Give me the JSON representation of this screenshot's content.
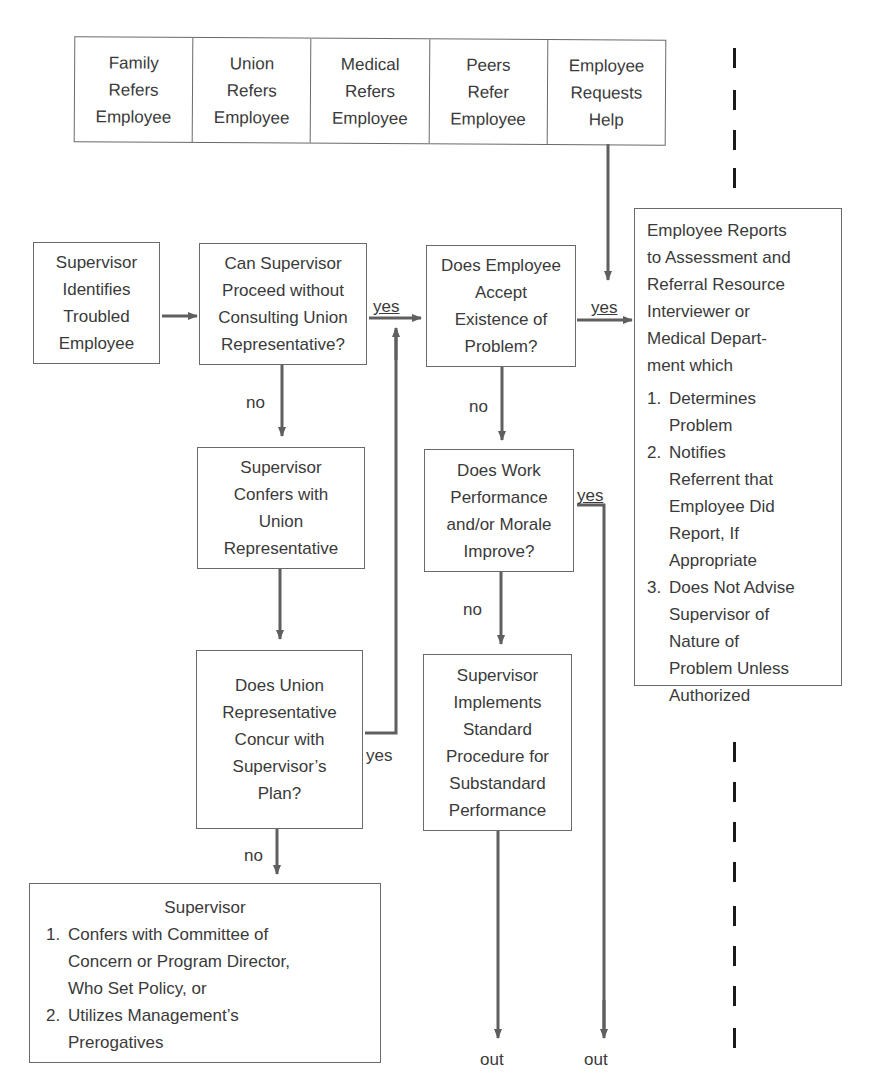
{
  "header": {
    "title": "PHASE I"
  },
  "referral_sources": [
    {
      "lines": [
        "Family",
        "Refers",
        "Employee"
      ]
    },
    {
      "lines": [
        "Union",
        "Refers",
        "Employee"
      ]
    },
    {
      "lines": [
        "Medical",
        "Refers",
        "Employee"
      ]
    },
    {
      "lines": [
        "Peers",
        "Refer",
        "Employee"
      ]
    },
    {
      "lines": [
        "Employee",
        "Requests",
        "Help"
      ]
    }
  ],
  "nodes": {
    "identify": {
      "lines": [
        "Supervisor",
        "Identifies",
        "Troubled",
        "Employee"
      ]
    },
    "proceed_without_union": {
      "lines": [
        "Can Supervisor",
        "Proceed without",
        "Consulting Union",
        "Representative?"
      ]
    },
    "accept_problem": {
      "lines": [
        "Does Employee",
        "Accept",
        "Existence of",
        "Problem?"
      ]
    },
    "confer_union": {
      "lines": [
        "Supervisor",
        "Confers with",
        "Union",
        "Representative"
      ]
    },
    "union_concur": {
      "lines": [
        "Does Union",
        "Representative",
        "Concur with",
        "Supervisor’s",
        "Plan?"
      ]
    },
    "performance_improve": {
      "lines": [
        "Does Work",
        "Performance",
        "and/or Morale",
        "Improve?"
      ]
    },
    "standard_procedure": {
      "lines": [
        "Supervisor",
        "Implements",
        "Standard",
        "Procedure for",
        "Substandard",
        "Performance"
      ]
    },
    "assessment": {
      "intro_lines": [
        "Employee Reports",
        "to Assessment and",
        "Referral Resource",
        "Interviewer or",
        "Medical Depart-",
        "ment which"
      ],
      "items": [
        {
          "num": "1.",
          "lines": [
            "Determines",
            "Problem"
          ]
        },
        {
          "num": "2.",
          "lines": [
            "Notifies",
            "Referrent that",
            "Employee Did",
            "Report, If",
            "Appropriate"
          ]
        },
        {
          "num": "3.",
          "lines": [
            "Does Not Advise",
            "Supervisor of",
            "Nature of",
            "Problem Unless",
            "Authorized"
          ]
        }
      ]
    },
    "supervisor_options": {
      "title": "Supervisor",
      "items": [
        {
          "num": "1.",
          "lines": [
            "Confers with Committee of",
            "Concern or Program Director,",
            "Who Set Policy, or"
          ]
        },
        {
          "num": "2.",
          "lines": [
            "Utilizes Management’s",
            "Prerogatives"
          ]
        }
      ]
    }
  },
  "edge_labels": {
    "yes_proceed": "yes",
    "yes_accept": "yes",
    "no_proceed": "no",
    "no_accept": "no",
    "yes_improve": "yes",
    "no_improve": "no",
    "yes_concur": "yes",
    "no_concur": "no",
    "out_left": "out",
    "out_right": "out"
  },
  "colors": {
    "line": "#5f5f5f",
    "box_border": "#6a6a6a",
    "text": "#3a3a3a",
    "dash": "#1a1a1a"
  }
}
